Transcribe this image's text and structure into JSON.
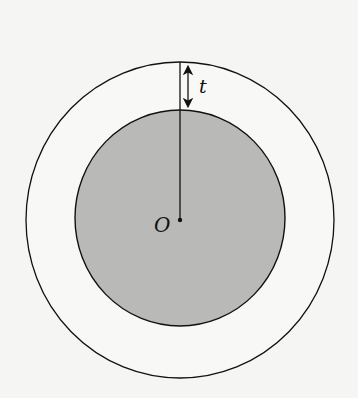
{
  "diagram": {
    "colors": {
      "background": "#f5f5f3",
      "inner_fill": "#b9b9b7",
      "stroke": "#111111"
    },
    "center": {
      "x": 180,
      "y": 220
    },
    "outer_circle": {
      "rx": 154,
      "ry": 158
    },
    "inner_circle": {
      "rx": 105,
      "ry": 108
    },
    "labels": {
      "center": "O",
      "thickness": "t"
    }
  }
}
